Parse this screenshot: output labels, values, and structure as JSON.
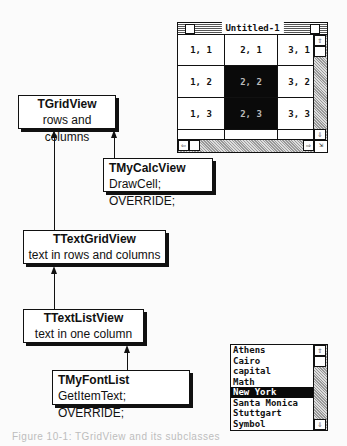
{
  "diagram": {
    "classes": [
      {
        "id": "tgridview",
        "name": "TGridView",
        "desc": "rows and columns"
      },
      {
        "id": "tmycalcview",
        "name": "TMyCalcView",
        "desc": "DrawCell; OVERRIDE;"
      },
      {
        "id": "ttextgridview",
        "name": "TTextGridView",
        "desc": "text in rows and columns"
      },
      {
        "id": "ttextlistview",
        "name": "TTextListView",
        "desc": "text in one column"
      },
      {
        "id": "tmyfontlist",
        "name": "TMyFontList",
        "desc": "GetItemText; OVERRIDE;"
      }
    ],
    "edges": [
      {
        "from": "tmycalcview",
        "to": "tgridview"
      },
      {
        "from": "ttextgridview",
        "to": "tgridview"
      },
      {
        "from": "ttextlistview",
        "to": "ttextgridview"
      },
      {
        "from": "tmyfontlist",
        "to": "ttextlistview"
      }
    ]
  },
  "window": {
    "title": "Untitled-1",
    "cells": [
      [
        "1, 1",
        "2, 1",
        "3, 1"
      ],
      [
        "1, 2",
        "2, 2",
        "3, 2"
      ],
      [
        "1, 3",
        "2, 3",
        "3, 3"
      ]
    ],
    "selected_cells": [
      "2, 2",
      "2, 3"
    ]
  },
  "font_list": {
    "items": [
      "Athens",
      "Cairo",
      "capital",
      "Math",
      "New York",
      "Santa Monica",
      "Stuttgart",
      "Symbol"
    ],
    "selected": "New York"
  },
  "caption": "Figure 10-1: TGridView and its subclasses"
}
